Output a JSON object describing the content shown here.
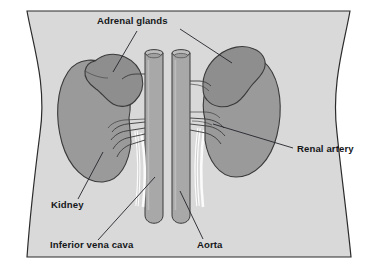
{
  "figure": {
    "background_color": "#ffffff",
    "border_color": "#2b2b2b"
  },
  "colors": {
    "body_fill": "#d9d9d9",
    "body_outline": "#2b2b2b",
    "organ_fill": "#9a9a9a",
    "organ_outline": "#3a3a3a",
    "vessel_fill": "#a8a8a8",
    "vessel_outline": "#3a3a3a",
    "ureter_fill": "#fbfbfb",
    "leader_line": "#22242a",
    "text": "#15171a"
  },
  "labels": [
    {
      "id": "adrenal-glands",
      "text": "Adrenal glands",
      "x": 97,
      "y": 24,
      "anchor": "start"
    },
    {
      "id": "renal-artery",
      "text": "Renal artery",
      "x": 297,
      "y": 152,
      "anchor": "start"
    },
    {
      "id": "kidney",
      "text": "Kidney",
      "x": 51,
      "y": 208,
      "anchor": "start"
    },
    {
      "id": "inferior-vena-cava",
      "text": "Inferior vena cava",
      "x": 50,
      "y": 248,
      "anchor": "start"
    },
    {
      "id": "aorta",
      "text": "Aorta",
      "x": 197,
      "y": 248,
      "anchor": "start"
    }
  ],
  "structures": [
    {
      "id": "torso",
      "name": "torso-body-outline"
    },
    {
      "id": "left-kidney",
      "name": "left-kidney"
    },
    {
      "id": "right-kidney",
      "name": "right-kidney"
    },
    {
      "id": "left-adrenal-gland",
      "name": "left-adrenal-gland"
    },
    {
      "id": "right-adrenal-gland",
      "name": "right-adrenal-gland"
    },
    {
      "id": "inferior-vena-cava",
      "name": "inferior-vena-cava-vessel"
    },
    {
      "id": "aorta",
      "name": "aorta-vessel"
    },
    {
      "id": "left-renal-vessels",
      "name": "left-renal-vessels"
    },
    {
      "id": "right-renal-vessels",
      "name": "right-renal-vessels"
    },
    {
      "id": "left-ureter",
      "name": "left-ureter"
    },
    {
      "id": "right-ureter",
      "name": "right-ureter"
    }
  ]
}
